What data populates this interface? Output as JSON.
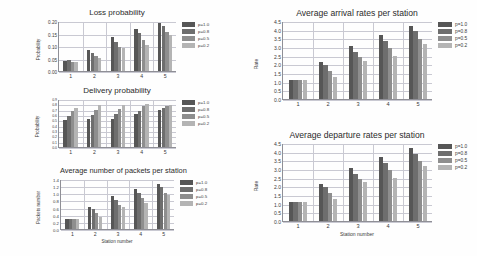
{
  "figure": {
    "background": "#fefefe",
    "series_colors": [
      "#565656",
      "#6e6e6e",
      "#8e8e8e",
      "#b4b4b4"
    ],
    "axis_color": "#8f8f96",
    "grid_color": "#c9c9d2"
  },
  "legend": {
    "entries": [
      {
        "label": "p=1.0",
        "color": "#565656"
      },
      {
        "label": "p=0.8",
        "color": "#6e6e6e"
      },
      {
        "label": "p=0.5",
        "color": "#8e8e8e"
      },
      {
        "label": "p=0.2",
        "color": "#b4b4b4"
      }
    ]
  },
  "chart_data": [
    {
      "id": "loss-probability",
      "type": "bar",
      "title": "Loss probability",
      "xlabel": "",
      "ylabel": "Probability",
      "categories": [
        "1",
        "2",
        "3",
        "4",
        "5"
      ],
      "xticklabels": [
        "1",
        "2",
        "3",
        "4",
        "5"
      ],
      "yticklabels": [
        "0.00",
        "0.05",
        "0.10",
        "0.15",
        "0.20"
      ],
      "yticks": [
        0.0,
        0.05,
        0.1,
        0.15,
        0.2
      ],
      "ylim": [
        0.0,
        0.2
      ],
      "grid": true,
      "legend_position": "right",
      "series": [
        {
          "name": "p=1.0",
          "values": [
            0.04,
            0.086,
            0.138,
            0.17,
            0.193
          ]
        },
        {
          "name": "p=0.8",
          "values": [
            0.043,
            0.073,
            0.118,
            0.153,
            0.18
          ]
        },
        {
          "name": "p=0.5",
          "values": [
            0.038,
            0.06,
            0.096,
            0.125,
            0.157
          ]
        },
        {
          "name": "p=0.2",
          "values": [
            0.038,
            0.052,
            0.091,
            0.105,
            0.143
          ]
        }
      ]
    },
    {
      "id": "delivery-probability",
      "type": "bar",
      "title": "Delivery probability",
      "xlabel": "",
      "ylabel": "Probability",
      "categories": [
        "1",
        "2",
        "3",
        "4",
        "5"
      ],
      "xticklabels": [
        "1",
        "2",
        "3",
        "4",
        "5"
      ],
      "yticklabels": [
        "0.0",
        "0.1",
        "0.2",
        "0.3",
        "0.4",
        "0.5",
        "0.6",
        "0.7",
        "0.8",
        "0.9"
      ],
      "yticks": [
        0.0,
        0.1,
        0.2,
        0.3,
        0.4,
        0.5,
        0.6,
        0.7,
        0.8,
        0.9
      ],
      "ylim": [
        0.0,
        0.9
      ],
      "grid": true,
      "legend_position": "right",
      "series": [
        {
          "name": "p=1.0",
          "values": [
            0.5,
            0.52,
            0.52,
            0.62,
            0.7
          ]
        },
        {
          "name": "p=0.8",
          "values": [
            0.58,
            0.6,
            0.62,
            0.68,
            0.73
          ]
        },
        {
          "name": "p=0.5",
          "values": [
            0.68,
            0.7,
            0.72,
            0.76,
            0.76
          ]
        },
        {
          "name": "p=0.2",
          "values": [
            0.73,
            0.78,
            0.78,
            0.81,
            0.79
          ]
        }
      ]
    },
    {
      "id": "average-packets-per-station",
      "type": "bar",
      "title": "Average number of packets per station",
      "xlabel": "Station number",
      "ylabel": "Packets number",
      "categories": [
        "1",
        "2",
        "3",
        "4",
        "5"
      ],
      "xticklabels": [
        "1",
        "2",
        "3",
        "4",
        "5"
      ],
      "yticklabels": [
        "0.0",
        "0.2",
        "0.4",
        "0.6",
        "0.8",
        "1.0",
        "1.2",
        "1.4"
      ],
      "yticks": [
        0.0,
        0.2,
        0.4,
        0.6,
        0.8,
        1.0,
        1.2,
        1.4
      ],
      "ylim": [
        0.0,
        1.4
      ],
      "grid": true,
      "legend_position": "right",
      "series": [
        {
          "name": "p=1.0",
          "values": [
            0.28,
            0.62,
            0.92,
            1.12,
            1.27
          ]
        },
        {
          "name": "p=0.8",
          "values": [
            0.28,
            0.56,
            0.8,
            1.02,
            1.17
          ]
        },
        {
          "name": "p=0.5",
          "values": [
            0.28,
            0.44,
            0.68,
            0.88,
            1.02
          ]
        },
        {
          "name": "p=0.2",
          "values": [
            0.29,
            0.35,
            0.62,
            0.74,
            0.94
          ]
        }
      ]
    },
    {
      "id": "average-arrival-rates",
      "type": "bar",
      "title": "Average arrival rates per station",
      "xlabel": "",
      "ylabel": "Rate",
      "categories": [
        "1",
        "2",
        "3",
        "4",
        "5"
      ],
      "xticklabels": [
        "1",
        "2",
        "3",
        "4",
        "5"
      ],
      "yticklabels": [
        "0.0",
        "0.5",
        "1.0",
        "1.5",
        "2.0",
        "2.5",
        "3.0",
        "3.5",
        "4.0",
        "4.5"
      ],
      "yticks": [
        0.0,
        0.5,
        1.0,
        1.5,
        2.0,
        2.5,
        3.0,
        3.5,
        4.0,
        4.5
      ],
      "ylim": [
        0.0,
        4.5
      ],
      "grid": true,
      "legend_position": "right",
      "series": [
        {
          "name": "p=1.0",
          "values": [
            1.12,
            2.15,
            3.05,
            3.7,
            4.2
          ]
        },
        {
          "name": "p=0.8",
          "values": [
            1.1,
            1.95,
            2.7,
            3.35,
            3.9
          ]
        },
        {
          "name": "p=0.5",
          "values": [
            1.1,
            1.6,
            2.4,
            2.95,
            3.45
          ]
        },
        {
          "name": "p=0.2",
          "values": [
            1.1,
            1.28,
            2.22,
            2.5,
            3.15
          ]
        }
      ]
    },
    {
      "id": "average-departure-rates",
      "type": "bar",
      "title": "Average departure rates per station",
      "xlabel": "Station number",
      "ylabel": "Rate",
      "categories": [
        "1",
        "2",
        "3",
        "4",
        "5"
      ],
      "xticklabels": [
        "1",
        "2",
        "3",
        "4",
        "5"
      ],
      "yticklabels": [
        "0.0",
        "0.5",
        "1.0",
        "1.5",
        "2.0",
        "2.5",
        "3.0",
        "3.5",
        "4.0",
        "4.5"
      ],
      "yticks": [
        0.0,
        0.5,
        1.0,
        1.5,
        2.0,
        2.5,
        3.0,
        3.5,
        4.0,
        4.5
      ],
      "ylim": [
        0.0,
        4.5
      ],
      "grid": true,
      "legend_position": "right",
      "series": [
        {
          "name": "p=1.0",
          "values": [
            1.12,
            2.15,
            3.05,
            3.72,
            4.22
          ]
        },
        {
          "name": "p=0.8",
          "values": [
            1.08,
            1.95,
            2.72,
            3.35,
            3.88
          ]
        },
        {
          "name": "p=0.5",
          "values": [
            1.1,
            1.6,
            2.4,
            2.95,
            3.45
          ]
        },
        {
          "name": "p=0.2",
          "values": [
            1.12,
            1.28,
            2.25,
            2.5,
            3.15
          ]
        }
      ]
    }
  ]
}
